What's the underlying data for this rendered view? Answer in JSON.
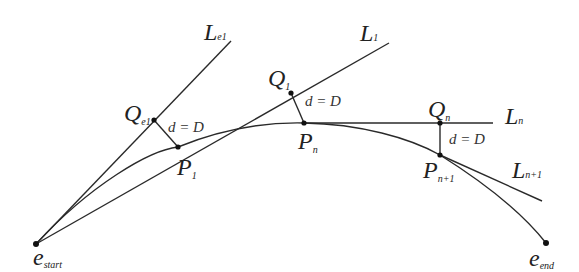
{
  "diagram": {
    "type": "curve-tangent-offset",
    "colors": {
      "stroke": "#2a2a2a",
      "background": "#ffffff"
    },
    "points": {
      "e_start": {
        "main": "e",
        "sub": "start"
      },
      "e_end": {
        "main": "e",
        "sub": "end"
      },
      "P1": {
        "main": "P",
        "sub": "1"
      },
      "Pn": {
        "main": "P",
        "sub": "n"
      },
      "Pn1": {
        "main": "P",
        "sub": "n+1"
      },
      "Qe1": {
        "main": "Q",
        "sub": "e1"
      },
      "Q1": {
        "main": "Q",
        "sub": "1"
      },
      "Qn": {
        "main": "Q",
        "sub": "n"
      }
    },
    "lines": {
      "Le1": {
        "main": "L",
        "sub": "e1"
      },
      "L1": {
        "main": "L",
        "sub": "1"
      },
      "Ln": {
        "main": "L",
        "sub": "n"
      },
      "Ln1": {
        "main": "L",
        "sub": "n+1"
      }
    },
    "distance_labels": [
      {
        "text": "d = D"
      },
      {
        "text": "d = D"
      },
      {
        "text": "d = D"
      }
    ]
  }
}
